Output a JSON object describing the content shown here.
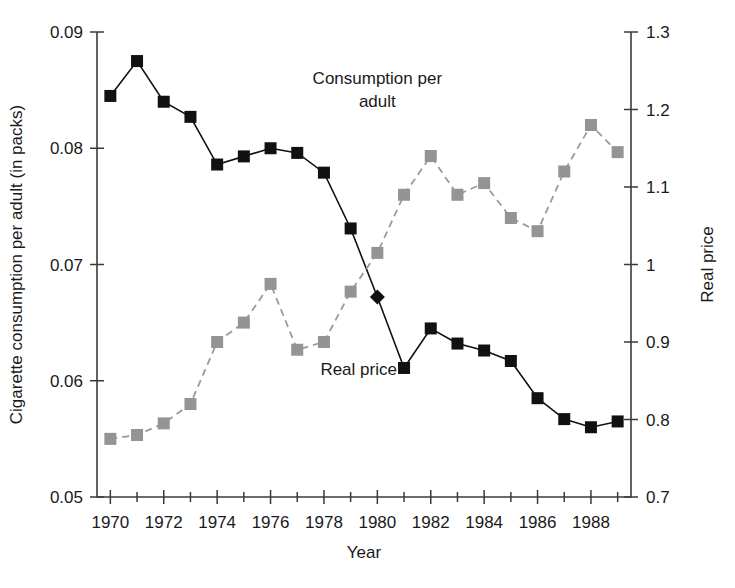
{
  "chart_data": {
    "type": "line",
    "title": "",
    "subtitle": "",
    "xlabel": "Year",
    "ylabel": "Cigarette consumption per adult (in packs)",
    "y2label": "Real price",
    "x": [
      1970,
      1971,
      1972,
      1973,
      1974,
      1975,
      1976,
      1977,
      1978,
      1979,
      1980,
      1981,
      1982,
      1983,
      1984,
      1985,
      1986,
      1987,
      1988,
      1989
    ],
    "xlim": [
      1969.5,
      1989.5
    ],
    "xticks": [
      1970,
      1972,
      1974,
      1976,
      1978,
      1980,
      1982,
      1984,
      1986,
      1988
    ],
    "xtick_labels": [
      "1970",
      "1972",
      "1974",
      "1976",
      "1978",
      "1980",
      "1982",
      "1984",
      "1986",
      "1988"
    ],
    "x_minor_ticks": [
      1971,
      1973,
      1975,
      1977,
      1979,
      1981,
      1983,
      1985,
      1987,
      1989
    ],
    "ylim": [
      0.05,
      0.09
    ],
    "yticks": [
      0.05,
      0.06,
      0.07,
      0.08,
      0.09
    ],
    "ytick_labels": [
      "0.05",
      "0.06",
      "0.07",
      "0.08",
      "0.09"
    ],
    "y2lim": [
      0.7,
      1.3
    ],
    "y2ticks": [
      0.7,
      0.8,
      0.9,
      1.0,
      1.1,
      1.2,
      1.3
    ],
    "y2tick_labels": [
      "0.7",
      "0.8",
      "0.9",
      "1",
      "1.1",
      "1.2",
      "1.3"
    ],
    "grid": false,
    "legend_position": "inline-annotations",
    "series": [
      {
        "name": "Consumption per adult",
        "axis": "left",
        "color": "#111111",
        "marker": "square",
        "linestyle": "solid",
        "annotation": "Consumption per adult",
        "values": [
          0.0845,
          0.0875,
          0.084,
          0.0827,
          0.0786,
          0.0793,
          0.08,
          0.0796,
          0.0779,
          0.0731,
          0.0672,
          0.0611,
          0.0645,
          0.0632,
          0.0626,
          0.0617,
          0.0585,
          0.0567,
          0.056,
          0.0565
        ]
      },
      {
        "name": "Real price",
        "axis": "right",
        "color": "#949494",
        "marker": "square",
        "linestyle": "dashed",
        "annotation": "Real price",
        "values": [
          0.775,
          0.78,
          0.795,
          0.82,
          0.9,
          0.925,
          0.975,
          0.89,
          0.9,
          0.965,
          1.015,
          1.09,
          1.14,
          1.09,
          1.105,
          1.06,
          1.043,
          1.12,
          1.18,
          1.145
        ]
      }
    ],
    "annotations": [
      {
        "text": "Consumption per adult",
        "x": 1980,
        "y_axis": "left",
        "y": 0.0855
      },
      {
        "text": "Real price",
        "x": 1979.3,
        "y_axis": "left",
        "y": 0.0605
      }
    ]
  },
  "figure": {
    "background": "#ffffff",
    "axis_color": "#3a3a3a",
    "text_color": "#1a1a1a"
  }
}
